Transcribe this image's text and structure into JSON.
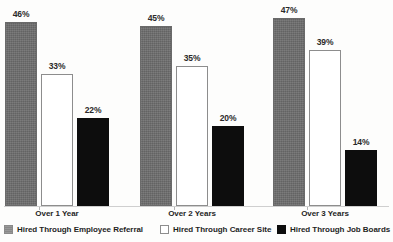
{
  "chart_data": {
    "type": "bar",
    "title": "",
    "subtitle": "",
    "xlabel": "",
    "ylabel": "",
    "ylim": [
      0,
      50
    ],
    "grid": false,
    "legend_position": "bottom",
    "categories": [
      "Over 1 Year",
      "Over 2 Years",
      "Over 3 Years"
    ],
    "series": [
      {
        "name": "Hired Through Employee Referral",
        "style": "gray",
        "color": "#6d6d6d",
        "values": [
          46,
          45,
          47
        ],
        "labels": [
          "46%",
          "45%",
          "47%"
        ]
      },
      {
        "name": "Hired Through Career Site",
        "style": "white",
        "color": "#ffffff",
        "values": [
          33,
          35,
          39
        ],
        "labels": [
          "33%",
          "35%",
          "39%"
        ]
      },
      {
        "name": "Hired Through Job Boards",
        "style": "black",
        "color": "#0d0d0d",
        "values": [
          22,
          20,
          14
        ],
        "labels": [
          "22%",
          "20%",
          "14%"
        ]
      }
    ]
  },
  "axis": {
    "baseline_color": "#cfcfcf"
  },
  "groups": [
    {
      "label": "Over 1 Year",
      "bars": [
        {
          "label": "46%",
          "value": 46,
          "series": "Hired Through Employee Referral"
        },
        {
          "label": "33%",
          "value": 33,
          "series": "Hired Through Career Site"
        },
        {
          "label": "22%",
          "value": 22,
          "series": "Hired Through Job Boards"
        }
      ]
    },
    {
      "label": "Over 2 Years",
      "bars": [
        {
          "label": "45%",
          "value": 45,
          "series": "Hired Through Employee Referral"
        },
        {
          "label": "35%",
          "value": 35,
          "series": "Hired Through Career Site"
        },
        {
          "label": "20%",
          "value": 20,
          "series": "Hired Through Job Boards"
        }
      ]
    },
    {
      "label": "Over 3 Years",
      "bars": [
        {
          "label": "47%",
          "value": 47,
          "series": "Hired Through Employee Referral"
        },
        {
          "label": "39%",
          "value": 39,
          "series": "Hired Through Career Site"
        },
        {
          "label": "14%",
          "value": 14,
          "series": "Hired Through Job Boards"
        }
      ]
    }
  ],
  "legend": {
    "items": [
      {
        "label": "Hired Through Employee Referral",
        "style": "gray"
      },
      {
        "label": "Hired Through Career Site",
        "style": "white"
      },
      {
        "label": "Hired Through Job Boards",
        "style": "black"
      }
    ]
  }
}
